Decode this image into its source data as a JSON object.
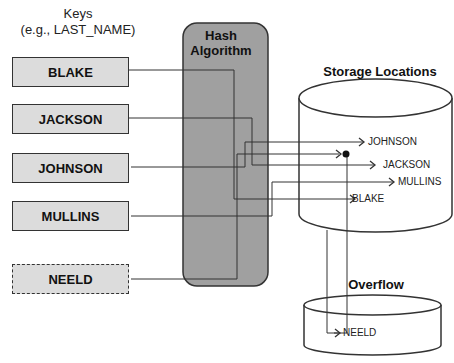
{
  "keys": {
    "title_line1": "Keys",
    "title_line2": "(e.g., LAST_NAME)",
    "items": [
      {
        "label": "BLAKE",
        "style": "solid"
      },
      {
        "label": "JACKSON",
        "style": "solid"
      },
      {
        "label": "JOHNSON",
        "style": "solid"
      },
      {
        "label": "MULLINS",
        "style": "solid"
      },
      {
        "label": "NEELD",
        "style": "dashed"
      }
    ]
  },
  "hash": {
    "title_line1": "Hash",
    "title_line2": "Algorithm",
    "fill": "#a0a0a0"
  },
  "storage": {
    "title": "Storage Locations",
    "slots": [
      "JOHNSON",
      "JACKSON",
      "MULLINS",
      "BLAKE"
    ]
  },
  "overflow": {
    "title": "Overflow",
    "slots": [
      "NEELD"
    ]
  },
  "colors": {
    "key_fill": "#dcdcdc",
    "hash_fill": "#a0a0a0",
    "line": "#333333"
  }
}
